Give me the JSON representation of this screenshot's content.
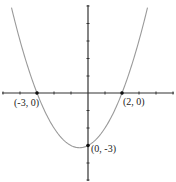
{
  "chart_data": {
    "type": "line",
    "title": "",
    "xlabel": "",
    "ylabel": "",
    "equation": "y = 0.5(x + 3)(x - 2)",
    "xlim": [
      -5,
      5
    ],
    "ylim": [
      -5,
      5
    ],
    "grid": false,
    "x_ticks": [
      -5,
      -4,
      -3,
      -2,
      -1,
      1,
      2,
      3,
      4,
      5
    ],
    "y_ticks": [
      -5,
      -4,
      -3,
      -2,
      -1,
      1,
      2,
      3,
      4,
      5
    ],
    "series": [
      {
        "name": "parabola",
        "x": [
          -4.5,
          -4,
          -3.5,
          -3,
          -2.5,
          -2,
          -1.5,
          -1,
          -0.5,
          0,
          0.5,
          1,
          1.5,
          2,
          2.5,
          3,
          3.5
        ],
        "y": [
          4.875,
          3,
          1.375,
          0,
          -1.125,
          -2,
          -2.625,
          -3,
          -3.125,
          -3,
          -2.625,
          -2,
          -1.125,
          0,
          1.375,
          3,
          4.875
        ]
      }
    ],
    "points": [
      {
        "x": -3,
        "y": 0,
        "label": "(-3, 0)"
      },
      {
        "x": 2,
        "y": 0,
        "label": "(2, 0)"
      },
      {
        "x": 0,
        "y": -3,
        "label": "(0, -3)"
      }
    ]
  },
  "labels": {
    "left_root": "(-3, 0)",
    "right_root": "(2, 0)",
    "y_intercept": "(0, -3)"
  },
  "colors": {
    "axis": "#333333",
    "curve": "#9a9a9a",
    "point": "#111111"
  }
}
